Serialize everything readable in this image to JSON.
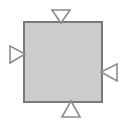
{
  "figure": {
    "title": "Square with four inward-pointing triangle markers",
    "background_color": "#ffffff",
    "width": 125,
    "height": 129
  },
  "palette": {
    "square_fill": "#cccccc",
    "square_stroke": "#7a7a7a",
    "triangle_fill": "#ffffff",
    "triangle_stroke": "#8c8c8c",
    "background": "#ffffff"
  },
  "square": {
    "label": "central-square",
    "x": 24,
    "y": 22,
    "width": 78,
    "height": 80,
    "stroke_width": 2,
    "fill": "#cccccc",
    "stroke": "#7a7a7a"
  },
  "markers": [
    {
      "id": "top",
      "label": "top-marker",
      "direction": "down",
      "points": "52,10 70,10 61,23",
      "fill": "#ffffff",
      "stroke": "#8c8c8c",
      "stroke_width": 1.6
    },
    {
      "id": "left",
      "label": "left-marker",
      "direction": "right",
      "points": "10,46 10,63 25,54",
      "fill": "#ffffff",
      "stroke": "#8c8c8c",
      "stroke_width": 1.6
    },
    {
      "id": "right",
      "label": "right-marker",
      "direction": "left",
      "points": "117,64 117,81 101,72",
      "fill": "#ffffff",
      "stroke": "#8c8c8c",
      "stroke_width": 1.6
    },
    {
      "id": "bottom",
      "label": "bottom-marker",
      "direction": "up",
      "points": "62,117 80,117 71,101",
      "fill": "#ffffff",
      "stroke": "#8c8c8c",
      "stroke_width": 1.6
    }
  ]
}
